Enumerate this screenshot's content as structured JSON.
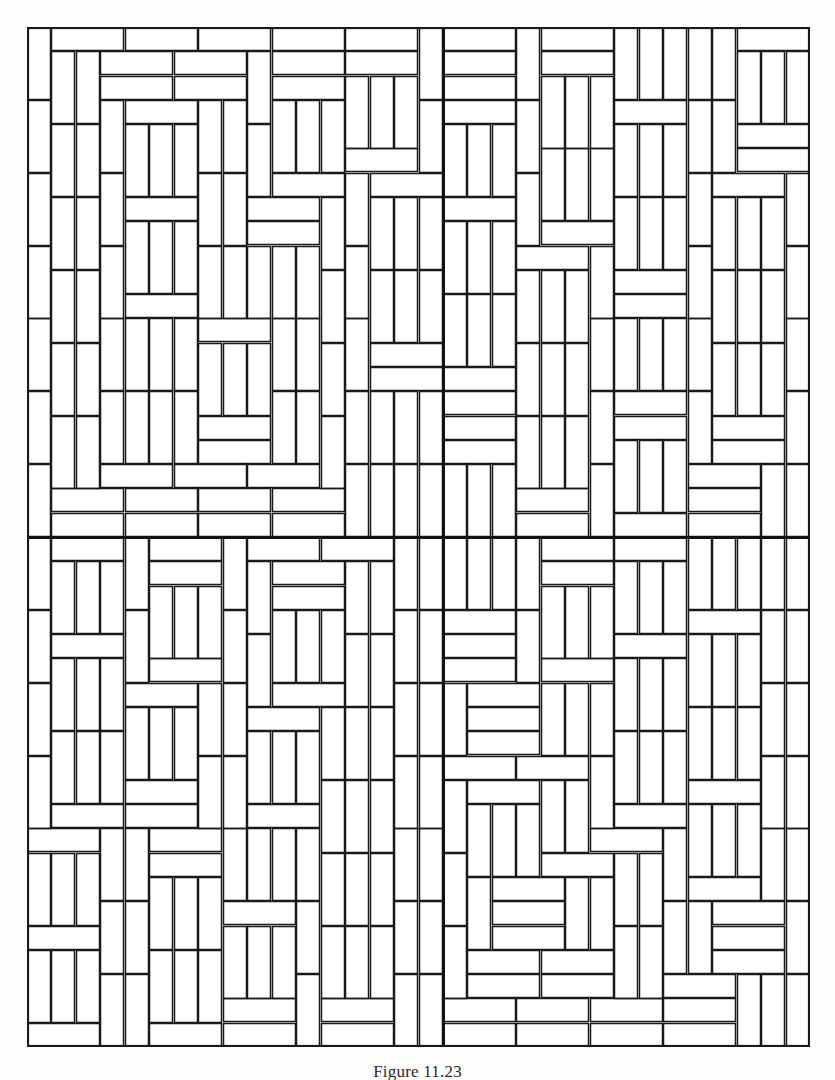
{
  "figure": {
    "caption": "Figure 11.23",
    "kind": "tiling-diagram",
    "frame": {
      "x": 27,
      "y": 27,
      "width": 783,
      "height": 1020
    },
    "grid": {
      "columns": 32,
      "rows": 42,
      "cell_width": 24.47,
      "cell_height": 24.29
    },
    "divider": {
      "center_x": 415,
      "center_y": 542,
      "thickness": 3
    },
    "colors": {
      "background": "#ffffff",
      "page": "#fdfdfc",
      "stroke": "#1a1a1a",
      "frame_stroke": "#1a1a1a",
      "divider_stroke": "#111111",
      "caption_text": "#2a2a2a"
    },
    "stroke_widths": {
      "tile": 1.5,
      "frame": 2.2,
      "divider": 3
    },
    "quadrants": [
      {
        "name": "top-left",
        "cols": [
          0,
          17
        ],
        "rows": [
          0,
          21
        ]
      },
      {
        "name": "top-right",
        "cols": [
          17,
          32
        ],
        "rows": [
          0,
          21
        ]
      },
      {
        "name": "bottom-left",
        "cols": [
          0,
          17
        ],
        "rows": [
          21,
          42
        ]
      },
      {
        "name": "bottom-right",
        "cols": [
          17,
          32
        ],
        "rows": [
          21,
          42
        ]
      }
    ]
  },
  "chart_data": {
    "type": "table",
    "title": "Figure 11.23",
    "xlabel": "",
    "ylabel": "",
    "note": "Rectangular 1x3 tiles (trominoes) laid in a non-periodic tiling; each tile is either horizontal (3 wide x 1 tall) or vertical (1 wide x 3 tall) in grid units.",
    "tile_unit": [
      1,
      3
    ],
    "tiles": [
      {
        "x": 0,
        "y": 0,
        "o": "h"
      },
      {
        "x": 3,
        "y": 0,
        "o": "v"
      },
      {
        "x": 4,
        "y": 0,
        "o": "h"
      },
      {
        "x": 7,
        "y": 0,
        "o": "v"
      },
      {
        "x": 8,
        "y": 0,
        "o": "v"
      },
      {
        "x": 9,
        "y": 0,
        "o": "h"
      },
      {
        "x": 12,
        "y": 0,
        "o": "v"
      },
      {
        "x": 13,
        "y": 0,
        "o": "h"
      },
      {
        "x": 16,
        "y": 0,
        "o": "v"
      },
      {
        "x": 17,
        "y": 0,
        "o": "h"
      },
      {
        "x": 20,
        "y": 0,
        "o": "v"
      },
      {
        "x": 21,
        "y": 0,
        "o": "v"
      },
      {
        "x": 22,
        "y": 0,
        "o": "h"
      },
      {
        "x": 25,
        "y": 0,
        "o": "v"
      },
      {
        "x": 26,
        "y": 0,
        "o": "h"
      },
      {
        "x": 29,
        "y": 0,
        "o": "v"
      },
      {
        "x": 30,
        "y": 0,
        "o": "v"
      },
      {
        "x": 31,
        "y": 0,
        "o": "v"
      },
      {
        "x": 0,
        "y": 1,
        "o": "v"
      },
      {
        "x": 1,
        "y": 1,
        "o": "v"
      },
      {
        "x": 2,
        "y": 1,
        "o": "v"
      },
      {
        "x": 4,
        "y": 1,
        "o": "h"
      },
      {
        "x": 9,
        "y": 1,
        "o": "h"
      },
      {
        "x": 13,
        "y": 1,
        "o": "h"
      },
      {
        "x": 17,
        "y": 1,
        "o": "h"
      },
      {
        "x": 22,
        "y": 1,
        "o": "h"
      },
      {
        "x": 26,
        "y": 1,
        "o": "h"
      },
      {
        "x": 3,
        "y": 2,
        "o": "h"
      },
      {
        "x": 7,
        "y": 2,
        "o": "h"
      },
      {
        "x": 12,
        "y": 2,
        "o": "h"
      },
      {
        "x": 16,
        "y": 2,
        "o": "h"
      },
      {
        "x": 20,
        "y": 2,
        "o": "h"
      },
      {
        "x": 25,
        "y": 2,
        "o": "h"
      },
      {
        "x": 29,
        "y": 2,
        "o": "h"
      }
    ],
    "grid_on": false,
    "legend": []
  }
}
